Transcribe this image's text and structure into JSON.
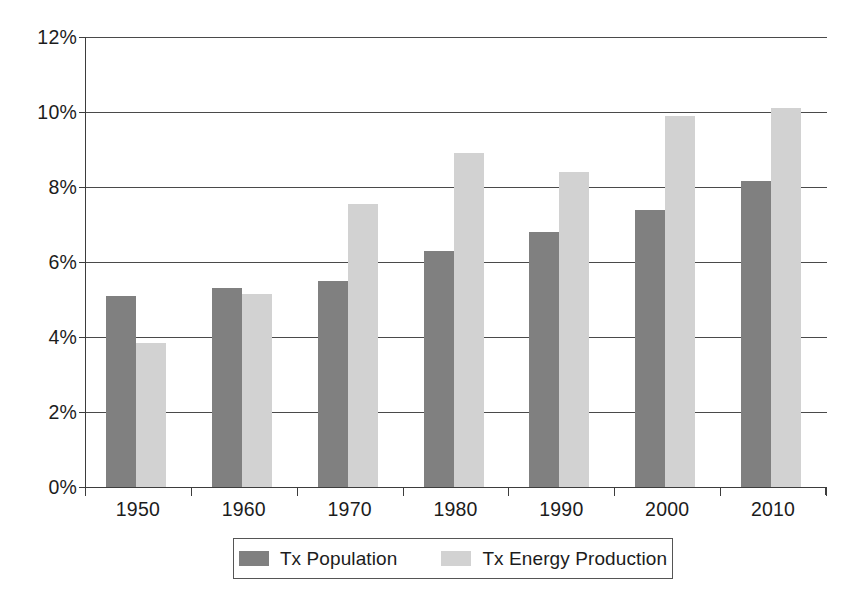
{
  "chart_data": {
    "type": "bar",
    "title": "",
    "subtitle": "",
    "xlabel": "",
    "ylabel": "",
    "categories": [
      "1950",
      "1960",
      "1970",
      "1980",
      "1990",
      "2000",
      "2010"
    ],
    "series": [
      {
        "name": "Tx Population",
        "color": "#808080",
        "values": [
          5.1,
          5.3,
          5.5,
          6.3,
          6.8,
          7.4,
          8.15
        ]
      },
      {
        "name": "Tx Energy Production",
        "color": "#d2d2d2",
        "values": [
          3.85,
          5.15,
          7.55,
          8.9,
          8.4,
          9.9,
          10.1
        ]
      }
    ],
    "ylim": [
      0,
      12
    ],
    "ytick_values": [
      0,
      2,
      4,
      6,
      8,
      10,
      12
    ],
    "ytick_labels": [
      "0%",
      "2%",
      "4%",
      "6%",
      "8%",
      "10%",
      "12%"
    ],
    "grid": true,
    "grid_axis": "y",
    "legend_position": "bottom",
    "value_suffix": "%"
  },
  "axes": {
    "y": {
      "ticks": [
        {
          "value": 12,
          "label": "12%"
        },
        {
          "value": 10,
          "label": "10%"
        },
        {
          "value": 8,
          "label": "8%"
        },
        {
          "value": 6,
          "label": "6%"
        },
        {
          "value": 4,
          "label": "4%"
        },
        {
          "value": 2,
          "label": "2%"
        },
        {
          "value": 0,
          "label": "0%"
        }
      ]
    },
    "x": {
      "ticks": [
        {
          "label": "1950"
        },
        {
          "label": "1960"
        },
        {
          "label": "1970"
        },
        {
          "label": "1980"
        },
        {
          "label": "1990"
        },
        {
          "label": "2000"
        },
        {
          "label": "2010"
        }
      ]
    }
  },
  "legend": {
    "entries": [
      {
        "label": "Tx Population",
        "color": "#808080"
      },
      {
        "label": "Tx Energy Production",
        "color": "#d2d2d2"
      }
    ]
  }
}
